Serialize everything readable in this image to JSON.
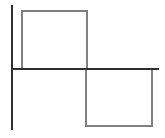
{
  "figure": {
    "title": "",
    "background_color": "#ffffff",
    "width": 165,
    "height": 138
  },
  "axes": {
    "y_axis": {
      "name": "vertical-axis",
      "color": "#2e2e2e",
      "x": 12,
      "y_top": 5,
      "y_bottom": 130,
      "stroke_width": 2.2
    },
    "x_axis": {
      "name": "horizontal-axis",
      "color": "#2e2e2e",
      "y": 69,
      "x_left": 12,
      "x_right": 159,
      "stroke_width": 2.2
    },
    "origin": {
      "x": 12,
      "y": 69
    }
  },
  "chart_data": {
    "type": "line",
    "title": "",
    "subtitle": "",
    "xlabel": "",
    "ylabel": "",
    "grid": false,
    "legend": null,
    "xlim": [
      0,
      165
    ],
    "ylim": [
      -69,
      69
    ],
    "series": [
      {
        "name": "square-wave",
        "color": "#808080",
        "stroke_width": 2,
        "description": "One period of a square wave: positive pulse then negative pulse, drawn as two open rectangles meeting at the origin axis",
        "points_px": [
          [
            22,
            69
          ],
          [
            22,
            11
          ],
          [
            87,
            11
          ],
          [
            87,
            69
          ],
          [
            86,
            69
          ],
          [
            86,
            126
          ],
          [
            152,
            126
          ],
          [
            152,
            69
          ]
        ],
        "values": [
          {
            "x": 22,
            "y": 0
          },
          {
            "x": 22,
            "y": 58
          },
          {
            "x": 87,
            "y": 58
          },
          {
            "x": 87,
            "y": 0
          },
          {
            "x": 86,
            "y": 0
          },
          {
            "x": 86,
            "y": -57
          },
          {
            "x": 152,
            "y": -57
          },
          {
            "x": 152,
            "y": 0
          }
        ]
      }
    ],
    "annotations": []
  },
  "shapes": {
    "upper_pulse": {
      "name": "positive-pulse-rectangle",
      "color": "#808080",
      "x1": 22,
      "y1": 11,
      "x2": 87,
      "y2": 69,
      "amplitude": 58
    },
    "lower_pulse": {
      "name": "negative-pulse-rectangle",
      "color": "#808080",
      "x1": 86,
      "y1": 69,
      "x2": 152,
      "y2": 126,
      "amplitude": -57
    }
  },
  "labels": {
    "tick_labels_x": [],
    "tick_labels_y": [],
    "text_items": []
  }
}
